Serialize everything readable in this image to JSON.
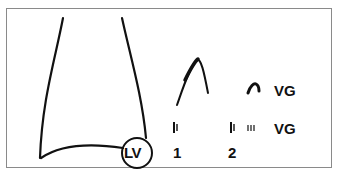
{
  "diagram": {
    "left_structure": {
      "name": "funnel-shaped outline",
      "circle_label": "LV"
    },
    "waveforms": {
      "large_peak": "peak waveform",
      "small_peak_label": "VG"
    },
    "tick_rows": {
      "row_label": "VG",
      "markers": [
        "1",
        "2"
      ]
    },
    "colors": {
      "stroke": "#111111",
      "frame": "#8a8a8a",
      "background": "#ffffff"
    }
  }
}
